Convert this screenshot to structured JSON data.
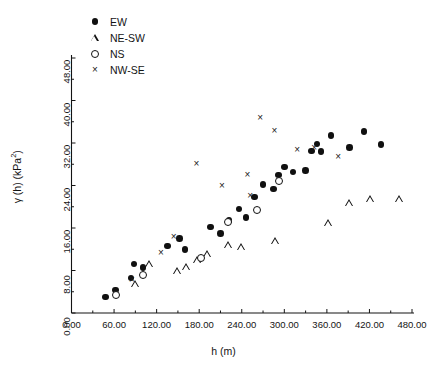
{
  "figure": {
    "background": "#ffffff",
    "foreground": "#141414"
  },
  "legend": {
    "position": "top-left",
    "entries": [
      {
        "label": "EW",
        "marker": "filled-circle"
      },
      {
        "label": "NE-SW",
        "marker": "open-triangle"
      },
      {
        "label": "NS",
        "marker": "open-circle"
      },
      {
        "label": "NW-SE",
        "marker": "cross"
      }
    ]
  },
  "axes": {
    "x": {
      "title": "h (m)",
      "min": 0,
      "max": 480,
      "step": 60,
      "ticks": [
        "0.00",
        "60.00",
        "120.00",
        "180.00",
        "240.00",
        "300.00",
        "360.00",
        "420.00",
        "480.00"
      ]
    },
    "y": {
      "title": "γ (h) (kPa",
      "title_sup": "2",
      "title_tail": ")",
      "min": 0,
      "max": 48,
      "step": 8,
      "ticks": [
        "0.00",
        "8.00",
        "16.00",
        "24.00",
        "32.00",
        "40.00",
        "48.00"
      ]
    }
  },
  "chart_data": {
    "type": "scatter",
    "title": "",
    "xlabel": "h (m)",
    "ylabel": "γ (h) (kPa2)",
    "xlim": [
      0,
      480
    ],
    "ylim": [
      0,
      48
    ],
    "grid": false,
    "legend_position": "top-left",
    "series": [
      {
        "name": "EW",
        "marker": "filled-circle",
        "color": "#101010",
        "points": [
          [
            48,
            3.0
          ],
          [
            62,
            4.3
          ],
          [
            84,
            6.6
          ],
          [
            88,
            9.2
          ],
          [
            101,
            8.6
          ],
          [
            135,
            12.6
          ],
          [
            152,
            14.0
          ],
          [
            160,
            12.0
          ],
          [
            196,
            16.2
          ],
          [
            210,
            15.0
          ],
          [
            222,
            17.4
          ],
          [
            236,
            19.6
          ],
          [
            246,
            18.0
          ],
          [
            258,
            21.8
          ],
          [
            270,
            24.2
          ],
          [
            285,
            23.3
          ],
          [
            292,
            26.0
          ],
          [
            300,
            27.5
          ],
          [
            312,
            26.5
          ],
          [
            330,
            26.8
          ],
          [
            338,
            30.5
          ],
          [
            346,
            31.8
          ],
          [
            352,
            30.4
          ],
          [
            366,
            33.4
          ],
          [
            392,
            31.2
          ],
          [
            412,
            34.2
          ],
          [
            436,
            31.7
          ]
        ]
      },
      {
        "name": "NE-SW",
        "marker": "open-triangle",
        "color": "#101010",
        "points": [
          [
            90,
            5.4
          ],
          [
            110,
            9.2
          ],
          [
            150,
            8.0
          ],
          [
            162,
            8.6
          ],
          [
            178,
            10.0
          ],
          [
            192,
            11.2
          ],
          [
            222,
            12.8
          ],
          [
            240,
            12.4
          ],
          [
            288,
            13.6
          ],
          [
            362,
            17.0
          ],
          [
            392,
            20.8
          ],
          [
            422,
            21.4
          ],
          [
            463,
            21.4
          ]
        ]
      },
      {
        "name": "NS",
        "marker": "open-circle",
        "color": "#101010",
        "points": [
          [
            62,
            3.4
          ],
          [
            101,
            7.2
          ],
          [
            182,
            10.4
          ],
          [
            220,
            17.2
          ],
          [
            262,
            19.4
          ],
          [
            292,
            24.8
          ]
        ]
      },
      {
        "name": "NW-SE",
        "marker": "cross",
        "color": "#1a1a1a",
        "points": [
          [
            85,
            6.2
          ],
          [
            126,
            11.4
          ],
          [
            144,
            14.4
          ],
          [
            176,
            28.2
          ],
          [
            212,
            24.0
          ],
          [
            248,
            26.0
          ],
          [
            252,
            22.0
          ],
          [
            266,
            36.8
          ],
          [
            286,
            34.4
          ],
          [
            318,
            30.8
          ],
          [
            342,
            31.2
          ],
          [
            376,
            29.4
          ]
        ]
      }
    ]
  }
}
